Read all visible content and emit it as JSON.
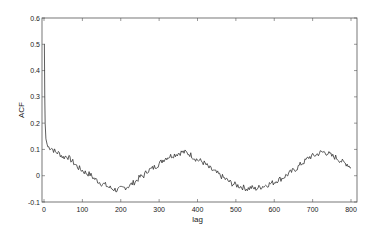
{
  "chart_data": {
    "type": "line",
    "title": "",
    "xlabel": "lag",
    "ylabel": "ACF",
    "xlim": [
      0,
      815
    ],
    "ylim": [
      -0.1,
      0.6
    ],
    "xticks": [
      0,
      100,
      200,
      300,
      400,
      500,
      600,
      700,
      800
    ],
    "yticks": [
      -0.1,
      0,
      0.1,
      0.2,
      0.3,
      0.4,
      0.5,
      0.6
    ],
    "grid": false,
    "legend": null,
    "line_color": "#333333",
    "series": [
      {
        "name": "ACF",
        "x": [
          0,
          1,
          2,
          3,
          5,
          8,
          10,
          20,
          30,
          40,
          50,
          60,
          70,
          80,
          90,
          100,
          110,
          120,
          130,
          140,
          150,
          160,
          170,
          180,
          190,
          200,
          210,
          220,
          230,
          240,
          250,
          260,
          270,
          280,
          290,
          300,
          310,
          320,
          330,
          340,
          350,
          360,
          370,
          380,
          390,
          400,
          410,
          420,
          430,
          440,
          450,
          460,
          470,
          480,
          490,
          500,
          510,
          520,
          530,
          540,
          550,
          560,
          570,
          580,
          590,
          600,
          610,
          620,
          630,
          640,
          650,
          660,
          670,
          680,
          690,
          700,
          710,
          720,
          730,
          740,
          750,
          760,
          770,
          780,
          790,
          800
        ],
        "values": [
          0.5,
          0.5,
          0.3,
          0.2,
          0.14,
          0.12,
          0.11,
          0.105,
          0.09,
          0.085,
          0.07,
          0.075,
          0.06,
          0.045,
          0.03,
          0.02,
          0.01,
          0.005,
          -0.01,
          -0.02,
          -0.03,
          -0.035,
          -0.045,
          -0.05,
          -0.055,
          -0.05,
          -0.045,
          -0.04,
          -0.03,
          -0.02,
          -0.005,
          0.0,
          0.02,
          0.025,
          0.035,
          0.045,
          0.06,
          0.07,
          0.075,
          0.08,
          0.085,
          0.09,
          0.088,
          0.082,
          0.07,
          0.06,
          0.055,
          0.045,
          0.03,
          0.02,
          0.01,
          0.0,
          -0.01,
          -0.02,
          -0.03,
          -0.035,
          -0.04,
          -0.045,
          -0.05,
          -0.045,
          -0.05,
          -0.045,
          -0.04,
          -0.035,
          -0.03,
          -0.025,
          -0.015,
          -0.01,
          0.0,
          0.01,
          0.02,
          0.03,
          0.045,
          0.055,
          0.07,
          0.075,
          0.08,
          0.088,
          0.09,
          0.085,
          0.075,
          0.07,
          0.06,
          0.05,
          0.045,
          0.03
        ]
      }
    ]
  },
  "plot_area": {
    "left": 44,
    "right": 351,
    "frame_right": 357,
    "top": 18,
    "bottom": 202
  }
}
